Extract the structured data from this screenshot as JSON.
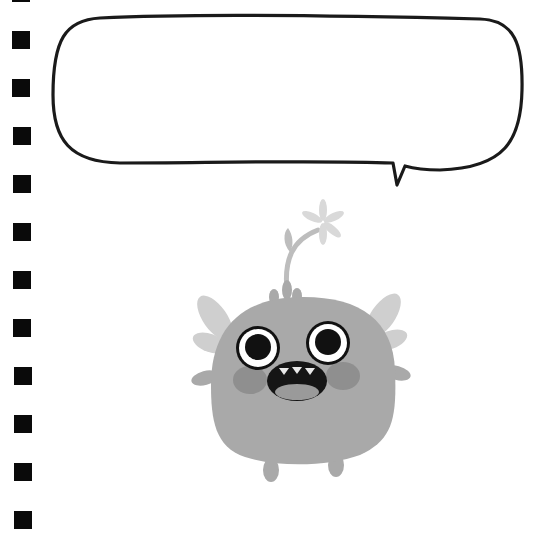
{
  "page": {
    "type": "notebook-page",
    "background": "#ffffff"
  },
  "binding_holes": {
    "count": 12,
    "color": "#0a0a0a",
    "positions_y": [
      -16,
      31,
      79,
      127,
      175,
      223,
      271,
      319,
      367,
      415,
      463,
      511
    ]
  },
  "speech_bubble": {
    "text": "",
    "stroke": "#1a1a1a",
    "fill": "#ffffff"
  },
  "character": {
    "name": "monster",
    "colors": {
      "body": "#a9a9a9",
      "wings": "#cfcfcf",
      "antenna": "#bdbdbd",
      "flower": "#d9d9d9",
      "cheeks": "#8f8f8f",
      "eye_white": "#ffffff",
      "pupil": "#111111",
      "mouth": "#151515",
      "tongue": "#9a9a9a",
      "teeth": "#e8e8e8"
    }
  }
}
